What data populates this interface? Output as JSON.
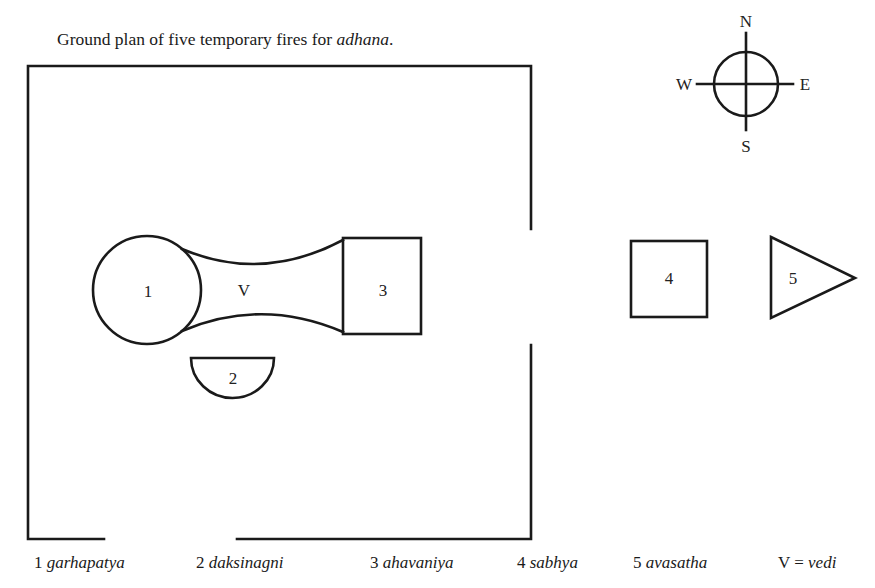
{
  "title": {
    "prefix": "Ground plan of five temporary fires for ",
    "emphasis": "adhana",
    "suffix": "."
  },
  "compass": {
    "north": "N",
    "south": "S",
    "east": "E",
    "west": "W"
  },
  "shapes": {
    "fire1": {
      "label": "1",
      "shape": "circle"
    },
    "vedi": {
      "label": "V",
      "shape": "concave-connector"
    },
    "fire2": {
      "label": "2",
      "shape": "half-circle"
    },
    "fire3": {
      "label": "3",
      "shape": "square"
    },
    "fire4": {
      "label": "4",
      "shape": "square"
    },
    "fire5": {
      "label": "5",
      "shape": "triangle"
    }
  },
  "legend": [
    {
      "num": "1",
      "name": "garhapatya"
    },
    {
      "num": "2",
      "name": "daksinagni"
    },
    {
      "num": "3",
      "name": "ahavaniya"
    },
    {
      "num": "4",
      "name": "sabhya"
    },
    {
      "num": "5",
      "name": "avasatha"
    },
    {
      "num": "V =",
      "name": "vedi"
    }
  ],
  "colors": {
    "stroke": "#1a1a1a",
    "background": "#ffffff"
  }
}
